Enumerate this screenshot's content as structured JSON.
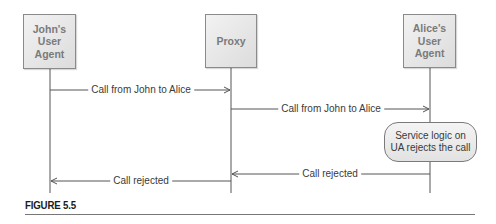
{
  "diagram": {
    "type": "sequence",
    "colors": {
      "box_fill": "#e6e6e6",
      "box_border": "#8a8a8a",
      "box_text": "#7a7a7a",
      "line": "#555555",
      "message_text": "#3a3a3a",
      "caption_text": "#1a1a1a"
    },
    "actors": [
      {
        "id": "john",
        "label": "John's\nUser\nAgent"
      },
      {
        "id": "proxy",
        "label": "Proxy"
      },
      {
        "id": "alice",
        "label": "Alice's\nUser\nAgent"
      }
    ],
    "messages": [
      {
        "from": "john",
        "to": "proxy",
        "label": "Call from John to Alice"
      },
      {
        "from": "proxy",
        "to": "alice",
        "label": "Call from John to Alice"
      },
      {
        "from": "alice",
        "to": "proxy",
        "label": "Call rejected"
      },
      {
        "from": "proxy",
        "to": "john",
        "label": "Call rejected"
      }
    ],
    "note": {
      "on": "alice",
      "label": "Service logic on\nUA rejects the call"
    }
  },
  "caption": {
    "figure_label": "FIGURE 5.5"
  }
}
